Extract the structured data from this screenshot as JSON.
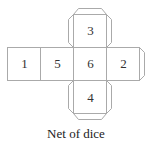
{
  "diagram": {
    "caption": "Net of dice",
    "faces": [
      {
        "position": "top",
        "label": "3"
      },
      {
        "position": "left-1",
        "label": "1"
      },
      {
        "position": "left-2",
        "label": "5"
      },
      {
        "position": "center",
        "label": "6"
      },
      {
        "position": "right",
        "label": "2"
      },
      {
        "position": "bottom",
        "label": "4"
      }
    ],
    "line_color": "#aaaaaa"
  }
}
